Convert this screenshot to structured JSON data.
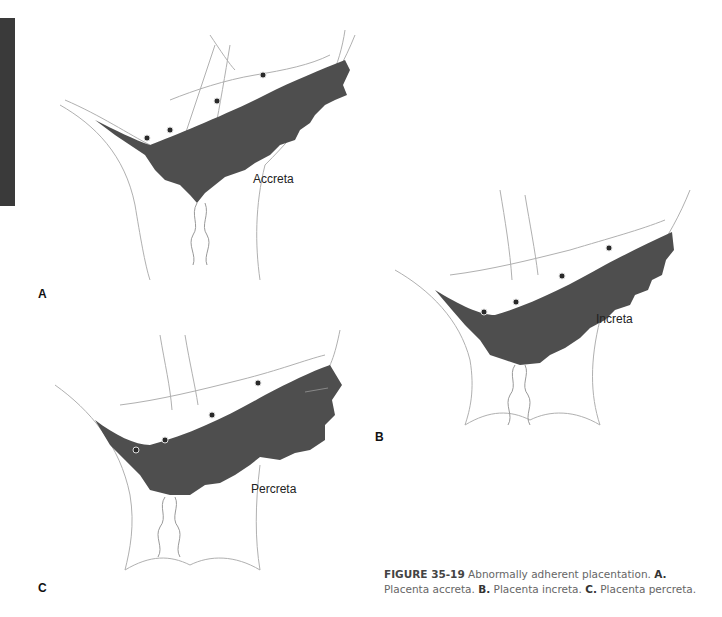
{
  "figure": {
    "number": "FIGURE 35-19",
    "title": "Abnormally adherent placentation.",
    "parts": [
      {
        "letter": "A.",
        "text": "Placenta accreta."
      },
      {
        "letter": "B.",
        "text": "Placenta increta."
      },
      {
        "letter": "C.",
        "text": "Placenta percreta."
      }
    ]
  },
  "panels": [
    {
      "id": "A",
      "letter": "A",
      "label": "Accreta"
    },
    {
      "id": "B",
      "letter": "B",
      "label": "Increta"
    },
    {
      "id": "C",
      "letter": "C",
      "label": "Percreta"
    }
  ],
  "colors": {
    "placenta": "#4e4e4e",
    "tissue_outline": "#9a9a9a",
    "edge_tab": "#3a3a3a"
  }
}
